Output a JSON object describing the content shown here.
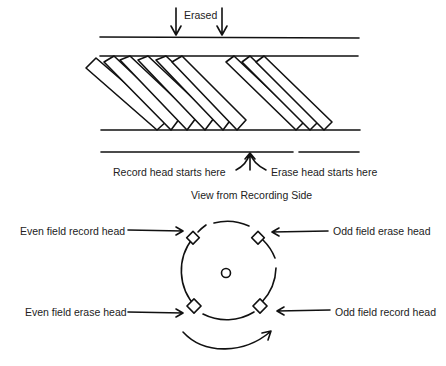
{
  "top_diagram": {
    "erased_label": "Erased",
    "record_start_label": "Record head starts here",
    "erase_start_label": "Erase head starts here",
    "caption": "View from Recording Side"
  },
  "drum_diagram": {
    "even_record_label": "Even field record head",
    "odd_erase_label": "Odd field erase head",
    "even_erase_label": "Even field erase head",
    "odd_record_label": "Odd field record head"
  },
  "colors": {
    "ink": "#111111",
    "background": "#ffffff"
  }
}
